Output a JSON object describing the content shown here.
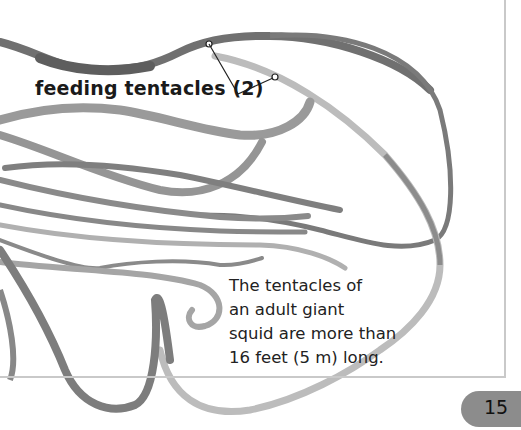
{
  "callout": {
    "label": "feeding tentacles (2)"
  },
  "caption": {
    "lines": [
      "The tentacles of",
      "an adult giant",
      "squid are more than",
      "16 feet (5 m) long."
    ]
  },
  "footer": {
    "page_number": "15"
  },
  "illustration": {
    "subject": "giant squid tentacles",
    "icon": "squid-tentacles-illustration"
  },
  "colors": {
    "frame": "#c9c9c9",
    "badge": "#8c8c8c",
    "tentacle_dark": "#6e6e6e",
    "tentacle_light": "#b8b8b8"
  }
}
